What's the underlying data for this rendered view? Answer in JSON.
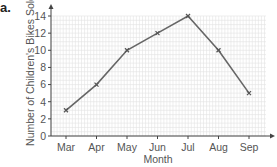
{
  "part_label": "a.",
  "chart_data": {
    "type": "line",
    "title": "",
    "xlabel": "Month",
    "ylabel": "Number of Children's Bikes Sold",
    "categories": [
      "Mar",
      "Apr",
      "May",
      "Jun",
      "Jul",
      "Aug",
      "Sep"
    ],
    "values": [
      3,
      6,
      10,
      12,
      14,
      10,
      5
    ],
    "y_ticks": [
      0,
      2,
      4,
      6,
      8,
      10,
      12,
      14
    ],
    "ylim": [
      0,
      14
    ],
    "grid": true,
    "marker": "x",
    "line_color": "#666666",
    "grid_color": "#e3e3e3"
  }
}
